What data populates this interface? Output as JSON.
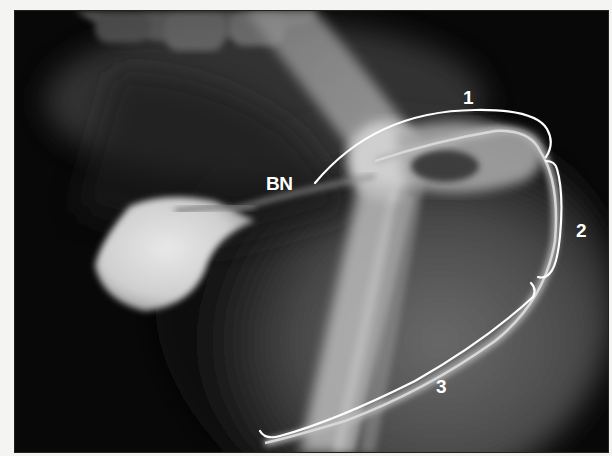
{
  "figure": {
    "type": "radiograph",
    "labels": {
      "bn": "BN",
      "segment_1": "1",
      "segment_2": "2",
      "segment_3": "3"
    },
    "colors": {
      "annotation": "#ffffff",
      "background": "#060606",
      "page": "#f4f4f2"
    }
  }
}
